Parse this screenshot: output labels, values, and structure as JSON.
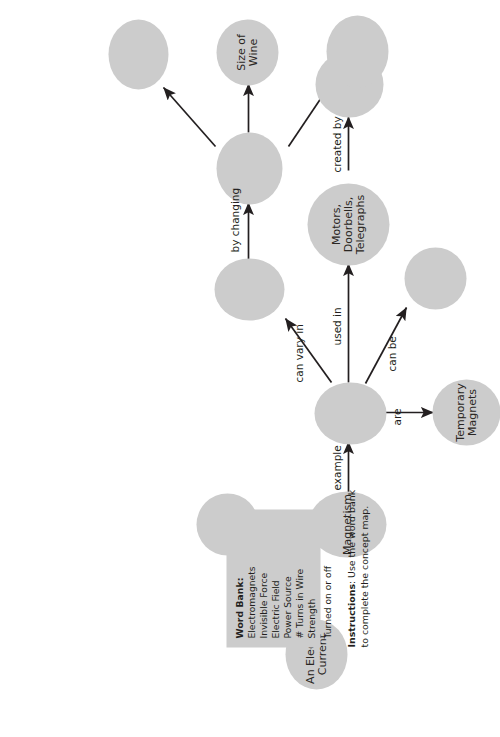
{
  "worksheet": {
    "type": "concept-map",
    "instructions": {
      "lead": "Instructions",
      "separator": ": ",
      "line1": "Use the word bank",
      "line2": "to complete the concept map."
    },
    "word_bank": {
      "title": "Word Bank:",
      "items": [
        "Electromagnets",
        "Invisible Force",
        "Electric Field",
        "Power Source",
        "# Turns in Wire",
        "Strength",
        "Turned on or off"
      ]
    },
    "nodes": [
      {
        "id": "electric-current",
        "label": "An Electric\nCurrent",
        "filled": true
      },
      {
        "id": "magnetism",
        "label": "Magnetism",
        "filled": true
      },
      {
        "id": "is-an-blank",
        "label": "",
        "filled": false
      },
      {
        "id": "example-hub",
        "label": "",
        "filled": false
      },
      {
        "id": "temporary-magnets",
        "label": "Temporary\nMagnets",
        "filled": true
      },
      {
        "id": "created-by-blank",
        "label": "",
        "filled": false
      },
      {
        "id": "can-be-blank",
        "label": "",
        "filled": false
      },
      {
        "id": "motors-doorbells",
        "label": "Motors,\nDoorbells,\nTelegraphs",
        "filled": true
      },
      {
        "id": "can-vary-in-blank",
        "label": "",
        "filled": false
      },
      {
        "id": "by-changing-blank1",
        "label": "",
        "filled": false
      },
      {
        "id": "size-of-wire",
        "label": "Size of Wine",
        "filled": true
      },
      {
        "id": "by-changing-blank2",
        "label": "",
        "filled": false
      }
    ],
    "edges": [
      {
        "id": "e1",
        "label": "can create",
        "from": "electric-current",
        "to": "magnetism"
      },
      {
        "id": "e2",
        "label": "is an",
        "from": "magnetism",
        "to": "is-an-blank"
      },
      {
        "id": "e3",
        "label": "example",
        "from": "magnetism",
        "to": "example-hub"
      },
      {
        "id": "e4",
        "label": "are",
        "from": "example-hub",
        "to": "temporary-magnets"
      },
      {
        "id": "e5",
        "label": "created by",
        "from": "temporary-magnets",
        "to": "created-by-blank"
      },
      {
        "id": "e6",
        "label": "can be",
        "from": "example-hub",
        "to": "can-be-blank"
      },
      {
        "id": "e7",
        "label": "used in",
        "from": "example-hub",
        "to": "motors-doorbells"
      },
      {
        "id": "e8",
        "label": "can vary in",
        "from": "example-hub",
        "to": "can-vary-in-blank"
      },
      {
        "id": "e9",
        "label": "by changing",
        "from": "can-vary-in-blank",
        "to": "by-changing-blank1"
      },
      {
        "id": "e10",
        "label": "",
        "from": "by-changing-blank1",
        "to": "size-of-wire"
      },
      {
        "id": "e11",
        "label": "",
        "from": "by-changing-blank1",
        "to": "by-changing-blank2"
      }
    ],
    "colors": {
      "node_fill": "#cccccc",
      "ink": "#231f20",
      "page": "#ffffff"
    }
  }
}
